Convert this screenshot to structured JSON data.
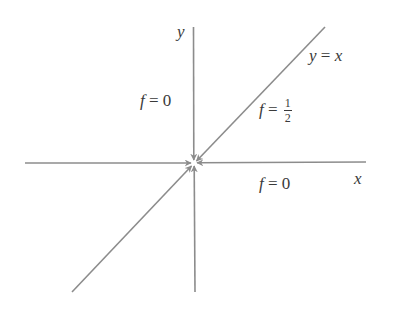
{
  "diagram": {
    "colors": {
      "line": "#8c8c8c",
      "text": "#3a3a3a",
      "background": "#ffffff"
    },
    "axes": {
      "x_label": "x",
      "y_label": "y"
    },
    "lines": [
      {
        "id": "x-axis",
        "label": "x"
      },
      {
        "id": "y-axis",
        "label": "y"
      },
      {
        "id": "diagonal",
        "label": "y = x"
      }
    ],
    "labels": {
      "diagonal_eq": {
        "lhs": "y",
        "op": "=",
        "rhs": "x"
      },
      "upper_left": {
        "var": "f",
        "op": "=",
        "value": "0"
      },
      "diagonal_value": {
        "var": "f",
        "op": "=",
        "num": "1",
        "den": "2"
      },
      "lower_right": {
        "var": "f",
        "op": "=",
        "value": "0"
      }
    },
    "arrows": [
      "along x-axis from left toward origin",
      "along x-axis from right toward origin",
      "along y-axis from top toward origin",
      "along y-axis from bottom toward origin",
      "along y = x from upper right toward origin",
      "along y = x from lower left toward origin"
    ]
  }
}
